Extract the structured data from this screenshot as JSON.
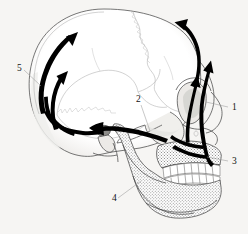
{
  "figure": {
    "kind": "anatomical-diagram",
    "background_color": "#f6f5f3",
    "line_color": "#4a4a4a",
    "arrow_color": "#000000",
    "suture_color": "#b4b4b4"
  },
  "labels": [
    {
      "id": "label-1",
      "text": "1",
      "x": 233,
      "y": 110,
      "leader_from": [
        228,
        107
      ],
      "leader_to": [
        205,
        101
      ]
    },
    {
      "id": "label-2",
      "text": "2",
      "x": 137,
      "y": 102,
      "leader_from": [
        141,
        105
      ],
      "leader_to": [
        150,
        130
      ]
    },
    {
      "id": "label-3",
      "text": "3",
      "x": 233,
      "y": 164,
      "leader_from": [
        228,
        161
      ],
      "leader_to": [
        207,
        157
      ]
    },
    {
      "id": "label-4",
      "text": "4",
      "x": 113,
      "y": 201,
      "leader_from": [
        118,
        198
      ],
      "leader_to": [
        141,
        181
      ]
    },
    {
      "id": "label-5",
      "text": "5",
      "x": 18,
      "y": 71,
      "leader_from": [
        24,
        70
      ],
      "leader_to": [
        40,
        85
      ]
    }
  ],
  "arrows": [
    {
      "id": "arrow-frontal-outer",
      "description": "upward arrow along outer face front, lateral to orbit",
      "direction": "up"
    },
    {
      "id": "arrow-frontal-inner",
      "description": "upward arrow through orbit, medial",
      "direction": "up"
    },
    {
      "id": "arrow-vault-right",
      "description": "arrow curving over right parietal toward vertex",
      "direction": "up-left"
    },
    {
      "id": "arrow-vault-left",
      "description": "arrow curving up left frontal toward vertex",
      "direction": "up-right"
    },
    {
      "id": "arrow-occipital-up",
      "description": "short upward arrow on left occipital",
      "direction": "up"
    },
    {
      "id": "arrow-base-horizontal",
      "description": "long horizontal arrow along skull base toward occiput",
      "direction": "left"
    },
    {
      "id": "arrow-base-lower",
      "description": "lower base arrow sweeping to occipital region",
      "direction": "left"
    }
  ],
  "colors": {
    "background": "#f6f5f3",
    "bone_outline": "#4a4a4a",
    "suture": "#b4b4b4",
    "arrow": "#000000",
    "shade": "#e4e3e1",
    "label_text": "#111111"
  }
}
